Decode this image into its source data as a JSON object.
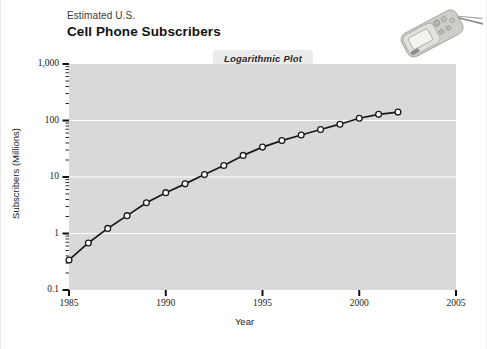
{
  "figure": {
    "title_line1": "Estimated U.S.",
    "title_line2": "Cell Phone Subscribers",
    "badge": "Logarithmic Plot",
    "phone_icon": "flip-phone-photo",
    "plot_background": "#d9d9d9",
    "gridline_color": "#ffffff",
    "line_color": "#1a1a1a",
    "marker_fill": "#ffffff"
  },
  "chart_data": {
    "type": "line",
    "title": "Estimated U.S. Cell Phone Subscribers",
    "subtitle": "Logarithmic Plot",
    "xlabel": "Year",
    "ylabel": "Subscribers (Millions)",
    "yscale": "log",
    "xscale": "linear",
    "xlim": [
      1985,
      2005
    ],
    "ylim": [
      0.1,
      1000
    ],
    "xticks": [
      1985,
      1990,
      1995,
      2000,
      2005
    ],
    "xticklabels": [
      "1985",
      "1990",
      "1995",
      "2000",
      "2005"
    ],
    "yticks": [
      0.1,
      1,
      10,
      100,
      1000
    ],
    "yticklabels": [
      "0.1",
      "1",
      "10",
      "100",
      "1,000"
    ],
    "grid": true,
    "grid_axis": "y",
    "legend": null,
    "marker": "open-circle",
    "x": [
      1985,
      1986,
      1987,
      1988,
      1989,
      1990,
      1991,
      1992,
      1993,
      1994,
      1995,
      1996,
      1997,
      1998,
      1999,
      2000,
      2001,
      2002
    ],
    "values": [
      0.34,
      0.68,
      1.23,
      2.07,
      3.51,
      5.28,
      7.56,
      11.03,
      16.01,
      24.13,
      33.79,
      44.04,
      55.31,
      69.21,
      86.05,
      109.48,
      128.37,
      140.77
    ],
    "series": [
      {
        "name": "Subscribers (Millions)",
        "x": [
          1985,
          1986,
          1987,
          1988,
          1989,
          1990,
          1991,
          1992,
          1993,
          1994,
          1995,
          1996,
          1997,
          1998,
          1999,
          2000,
          2001,
          2002
        ],
        "values": [
          0.34,
          0.68,
          1.23,
          2.07,
          3.51,
          5.28,
          7.56,
          11.03,
          16.01,
          24.13,
          33.79,
          44.04,
          55.31,
          69.21,
          86.05,
          109.48,
          128.37,
          140.77
        ]
      }
    ]
  }
}
